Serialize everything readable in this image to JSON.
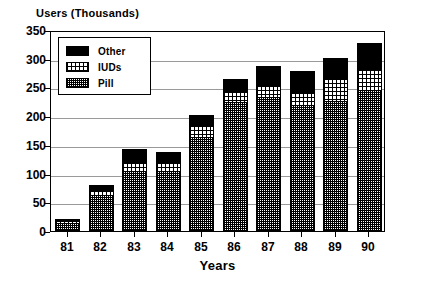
{
  "chart_data": {
    "type": "bar",
    "subtype": "stacked-bar",
    "title": "",
    "ylabel": "Users (Thousands)",
    "xlabel": "Years",
    "categories": [
      "81",
      "82",
      "83",
      "84",
      "85",
      "86",
      "87",
      "88",
      "89",
      "90"
    ],
    "ylim": [
      0,
      350
    ],
    "yticks": [
      0,
      50,
      100,
      150,
      200,
      250,
      300,
      350
    ],
    "ytick_labels": [
      "0",
      "50",
      "100",
      "150",
      "200",
      "250",
      "300",
      "350"
    ],
    "grid": true,
    "legend_position": "upper-left-inside",
    "series": [
      {
        "name": "Pill",
        "pattern": "crosshatch",
        "color": "#ffffff",
        "values": [
          14,
          63,
          105,
          104,
          163,
          224,
          234,
          220,
          227,
          245
        ]
      },
      {
        "name": "IUDs",
        "pattern": "light-dots",
        "color": "#ffffff",
        "values": [
          4,
          7,
          13,
          15,
          20,
          18,
          19,
          21,
          37,
          35
        ]
      },
      {
        "name": "Other",
        "pattern": "solid",
        "color": "#000000",
        "values": [
          3,
          10,
          25,
          19,
          19,
          23,
          34,
          38,
          37,
          47
        ]
      }
    ],
    "totals": [
      21,
      80,
      143,
      138,
      202,
      265,
      287,
      279,
      301,
      327
    ]
  },
  "legend": {
    "items": [
      {
        "label": "Other",
        "swatch": "solid-black-swatch"
      },
      {
        "label": "IUDs",
        "swatch": "light-dotted-swatch"
      },
      {
        "label": "Pill",
        "swatch": "crosshatch-swatch"
      }
    ]
  },
  "caption": {
    "text": ""
  }
}
